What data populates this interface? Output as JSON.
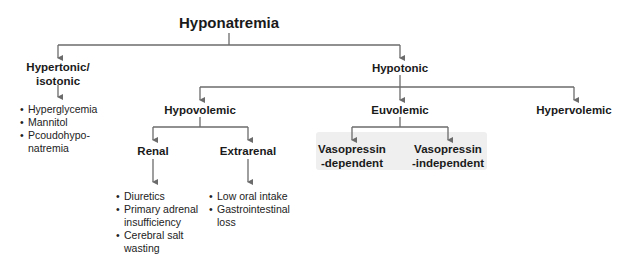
{
  "diagram": {
    "root": "Hyponatremia",
    "level1": {
      "left": {
        "label_line1": "Hypertonic/",
        "label_line2": "isotonic",
        "items": [
          "Hyperglycemia",
          "Mannitol",
          "Pcoudohypo-\nnatremia"
        ]
      },
      "right": {
        "label": "Hypotonic"
      }
    },
    "level2": {
      "hypovolemic": {
        "label": "Hypovolemic"
      },
      "euvolemic": {
        "label": "Euvolemic"
      },
      "hypervolemic": {
        "label": "Hypervolemic"
      }
    },
    "level3": {
      "renal": {
        "label": "Renal",
        "items": [
          "Diuretics",
          "Primary adrenal insufficiency",
          "Cerebral salt wasting"
        ]
      },
      "extrarenal": {
        "label": "Extrarenal",
        "items": [
          "Low oral intake",
          "Gastrointestinal loss"
        ]
      },
      "vaso_dep": {
        "line1": "Vasopressin",
        "line2": "-dependent"
      },
      "vaso_indep": {
        "line1": "Vasopressin",
        "line2": "-independent"
      }
    },
    "colors": {
      "line": "#6b6b6b",
      "highlight_box": "#efefef",
      "text": "#1a1a1a"
    }
  }
}
